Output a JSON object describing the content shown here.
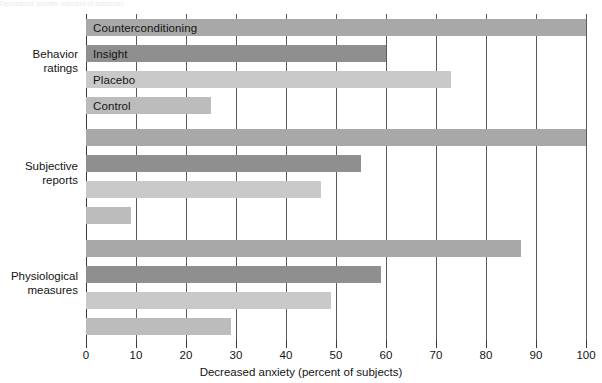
{
  "chart_data": {
    "type": "bar",
    "orientation": "horizontal",
    "title": "",
    "xlabel": "Decreased anxiety (percent of subjects)",
    "ylabel": "",
    "xlim": [
      0,
      100
    ],
    "xticks": [
      0,
      10,
      20,
      30,
      40,
      50,
      60,
      70,
      80,
      90,
      100
    ],
    "xticklabels": [
      "0",
      "10",
      "20",
      "30",
      "40",
      "50",
      "60",
      "70",
      "80",
      "90",
      "100"
    ],
    "grid": true,
    "grid_axis": "x",
    "legend": "in-bar labels on first group only",
    "categories": [
      "Behavior ratings",
      "Subjective reports",
      "Physiological measures"
    ],
    "series": [
      {
        "name": "Counterconditioning",
        "color": "#a8a8a8",
        "values": [
          100,
          100,
          87
        ]
      },
      {
        "name": "Insight",
        "color": "#8f8f8f",
        "values": [
          60,
          55,
          59
        ]
      },
      {
        "name": "Placebo",
        "color": "#c9c9c9",
        "values": [
          73,
          47,
          49
        ]
      },
      {
        "name": "Control",
        "color": "#bcbcbc",
        "values": [
          25,
          9,
          29
        ]
      }
    ]
  },
  "axis": {
    "x_title": "Decreased anxiety (percent of subjects)",
    "ticks": [
      "0",
      "10",
      "20",
      "30",
      "40",
      "50",
      "60",
      "70",
      "80",
      "90",
      "100"
    ]
  },
  "groups": [
    {
      "label_line1": "Behavior",
      "label_line2": "ratings",
      "bars": [
        {
          "name": "Counterconditioning",
          "label": "Counterconditioning",
          "value": 100,
          "color": "#a8a8a8",
          "show_label": true
        },
        {
          "name": "Insight",
          "label": "Insight",
          "value": 60,
          "color": "#8f8f8f",
          "show_label": true
        },
        {
          "name": "Placebo",
          "label": "Placebo",
          "value": 73,
          "color": "#c9c9c9",
          "show_label": true
        },
        {
          "name": "Control",
          "label": "Control",
          "value": 25,
          "color": "#bcbcbc",
          "show_label": true
        }
      ]
    },
    {
      "label_line1": "Subjective",
      "label_line2": "reports",
      "bars": [
        {
          "name": "Counterconditioning",
          "label": "",
          "value": 100,
          "color": "#a8a8a8",
          "show_label": false
        },
        {
          "name": "Insight",
          "label": "",
          "value": 55,
          "color": "#8f8f8f",
          "show_label": false
        },
        {
          "name": "Placebo",
          "label": "",
          "value": 47,
          "color": "#c9c9c9",
          "show_label": false
        },
        {
          "name": "Control",
          "label": "",
          "value": 9,
          "color": "#bcbcbc",
          "show_label": false
        }
      ]
    },
    {
      "label_line1": "Physiological",
      "label_line2": "measures",
      "bars": [
        {
          "name": "Counterconditioning",
          "label": "",
          "value": 87,
          "color": "#a8a8a8",
          "show_label": false
        },
        {
          "name": "Insight",
          "label": "",
          "value": 59,
          "color": "#8f8f8f",
          "show_label": false
        },
        {
          "name": "Placebo",
          "label": "",
          "value": 49,
          "color": "#c9c9c9",
          "show_label": false
        },
        {
          "name": "Control",
          "label": "",
          "value": 29,
          "color": "#bcbcbc",
          "show_label": false
        }
      ]
    }
  ],
  "top_clipped_text": "Decreased anxiety (percent of subjects)"
}
